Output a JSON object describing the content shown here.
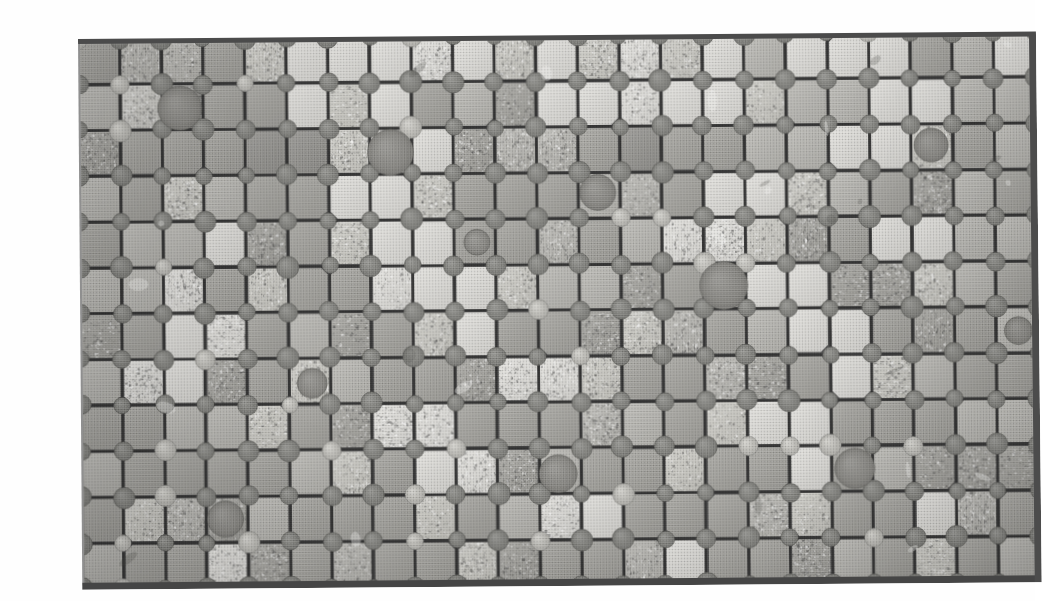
{
  "figure": {
    "kind": "grayscale-halftone-photograph",
    "caption_ghost": "",
    "plate": {
      "left_px": 38,
      "top_px": 23,
      "width_px": 958,
      "height_px": 550,
      "tilt_deg": -0.45,
      "border_color": "#4b4b4b",
      "background_color": "#9a9a9a"
    },
    "grid": {
      "columns": 23,
      "rows": 12,
      "pitch_x_px": 41.6,
      "pitch_y_px": 45.8,
      "grout_color": "#4f4f4f",
      "grout_width_px": 3.1,
      "tile_chamfer_px": 7
    },
    "studs": {
      "label": "circular stud at each grid intersection",
      "color": "#8a8a8a",
      "radius_px": 9.5,
      "edge_color": "#6f6f6f"
    },
    "large_dots": {
      "label": "oversized dark circular blemishes on scattered tiles",
      "color": "#8f8f8f",
      "radius_range_px": [
        14,
        24
      ],
      "positions": [
        {
          "col": 2,
          "row": 1,
          "r": 22
        },
        {
          "col": 7,
          "row": 2,
          "r": 23
        },
        {
          "col": 12,
          "row": 3,
          "r": 18
        },
        {
          "col": 20,
          "row": 2,
          "r": 17
        },
        {
          "col": 15,
          "row": 5,
          "r": 24
        },
        {
          "col": 5,
          "row": 7,
          "r": 15
        },
        {
          "col": 11,
          "row": 9,
          "r": 19
        },
        {
          "col": 18,
          "row": 9,
          "r": 20
        },
        {
          "col": 3,
          "row": 10,
          "r": 18
        },
        {
          "col": 9,
          "row": 4,
          "r": 13
        },
        {
          "col": 22,
          "row": 6,
          "r": 14
        }
      ]
    },
    "tone_palette": {
      "lightest": "#f2f2f0",
      "light": "#e3e2de",
      "mid_light": "#d2d1cc",
      "mid": "#bdbcb7",
      "mid_dark": "#a9a8a3",
      "dark": "#9a9995",
      "speckled": "#cfcec8"
    },
    "tile_tone_rows": [
      [
        4,
        3,
        3,
        4,
        6,
        1,
        1,
        1,
        1,
        1,
        6,
        1,
        6,
        1,
        6,
        1,
        3,
        1,
        1,
        1,
        4,
        3,
        1
      ],
      [
        3,
        2,
        5,
        4,
        4,
        1,
        6,
        1,
        4,
        3,
        4,
        1,
        1,
        1,
        1,
        1,
        6,
        3,
        3,
        1,
        1,
        3,
        3
      ],
      [
        4,
        4,
        4,
        4,
        5,
        5,
        6,
        1,
        1,
        4,
        3,
        3,
        4,
        5,
        4,
        4,
        3,
        3,
        1,
        1,
        6,
        4,
        3
      ],
      [
        3,
        4,
        6,
        3,
        4,
        4,
        1,
        1,
        6,
        4,
        4,
        4,
        3,
        3,
        4,
        1,
        1,
        6,
        3,
        4,
        4,
        3,
        4
      ],
      [
        4,
        3,
        3,
        1,
        4,
        4,
        6,
        1,
        1,
        4,
        4,
        3,
        4,
        3,
        1,
        1,
        6,
        4,
        4,
        1,
        1,
        3,
        3
      ],
      [
        3,
        3,
        1,
        4,
        6,
        4,
        4,
        1,
        1,
        1,
        6,
        3,
        3,
        4,
        4,
        4,
        1,
        1,
        4,
        4,
        6,
        3,
        4
      ],
      [
        4,
        4,
        1,
        1,
        4,
        3,
        4,
        4,
        6,
        1,
        4,
        4,
        4,
        6,
        3,
        4,
        3,
        1,
        1,
        4,
        4,
        4,
        3
      ],
      [
        3,
        1,
        1,
        4,
        4,
        6,
        3,
        4,
        4,
        4,
        1,
        1,
        6,
        4,
        4,
        3,
        4,
        4,
        1,
        6,
        3,
        4,
        4
      ],
      [
        4,
        4,
        3,
        3,
        6,
        4,
        4,
        1,
        1,
        4,
        4,
        4,
        3,
        3,
        4,
        6,
        1,
        1,
        4,
        4,
        4,
        3,
        3
      ],
      [
        3,
        4,
        4,
        4,
        4,
        3,
        6,
        4,
        1,
        1,
        4,
        3,
        4,
        4,
        6,
        4,
        4,
        1,
        4,
        3,
        4,
        4,
        4
      ],
      [
        4,
        6,
        3,
        4,
        3,
        4,
        4,
        4,
        6,
        4,
        3,
        1,
        1,
        4,
        4,
        4,
        3,
        6,
        4,
        4,
        1,
        3,
        4
      ],
      [
        3,
        4,
        4,
        1,
        4,
        4,
        3,
        4,
        4,
        6,
        4,
        4,
        4,
        3,
        1,
        4,
        4,
        4,
        3,
        4,
        6,
        4,
        3
      ]
    ]
  }
}
